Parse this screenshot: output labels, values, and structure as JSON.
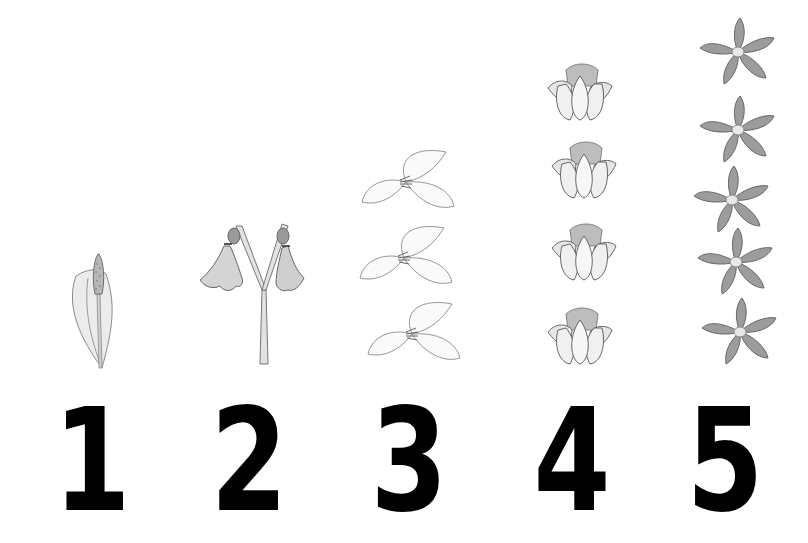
{
  "chart": {
    "title": "",
    "columns": [
      {
        "numeral": "1",
        "flower": "spadix-with-single-spathe",
        "count": 1,
        "left": 37
      },
      {
        "numeral": "2",
        "flower": "hanging-bell-pair",
        "count": 2,
        "left": 194
      },
      {
        "numeral": "3",
        "flower": "three-petal-trillium",
        "count": 3,
        "left": 354
      },
      {
        "numeral": "4",
        "flower": "four-tulip-blossoms",
        "count": 4,
        "left": 517
      },
      {
        "numeral": "5",
        "flower": "five-petal-star",
        "count": 5,
        "left": 670
      }
    ]
  },
  "colors": {
    "background": "#ffffff",
    "numeral": "#000000",
    "sketch_line": "#6b6b6b",
    "sketch_fill_light": "#e6e6e6",
    "sketch_fill_dark": "#9a9a9a"
  }
}
